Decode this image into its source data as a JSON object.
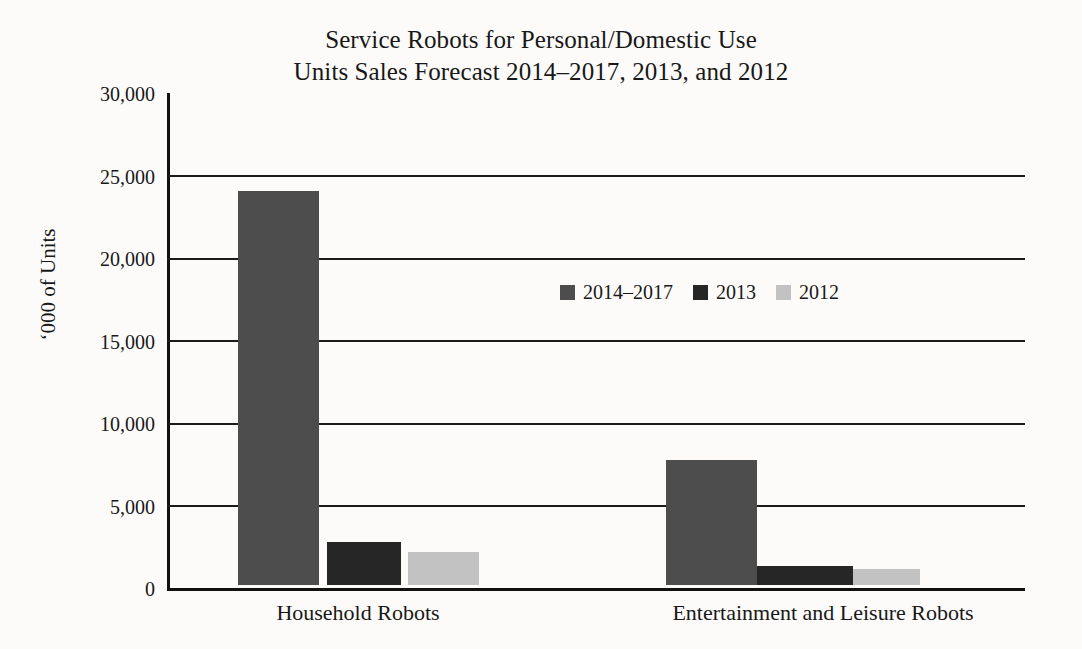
{
  "chart_data": {
    "type": "bar",
    "title": "Service Robots for Personal/Domestic Use Units Sales Forecast 2014–2017, 2013, and 2012",
    "title_lines": [
      "Service Robots for Personal/Domestic Use",
      "Units Sales Forecast 2014–2017, 2013, and 2012"
    ],
    "xlabel": "",
    "ylabel": "‘000 of Units",
    "ylim": [
      0,
      30000
    ],
    "ytick_values": [
      0,
      5000,
      10000,
      15000,
      20000,
      25000,
      30000
    ],
    "ytick_labels": [
      "0",
      "5,000",
      "10,000",
      "15,000",
      "20,000",
      "25,000",
      "30,000"
    ],
    "grid": "horizontal",
    "legend_position": "center",
    "categories": [
      "Household Robots",
      "Entertainment and Leisure Robots"
    ],
    "series": [
      {
        "name": "2014–2017",
        "color": "#4d4d4d",
        "values": [
          23900,
          7550
        ]
      },
      {
        "name": "2013",
        "color": "#262626",
        "values": [
          2600,
          1180
        ]
      },
      {
        "name": "2012",
        "color": "#c2c2c2",
        "values": [
          2000,
          1000
        ]
      }
    ]
  },
  "colors": {
    "background": "#fcfbf9",
    "axis": "#111111",
    "grid": "#1b1b1b",
    "text": "#181818"
  }
}
